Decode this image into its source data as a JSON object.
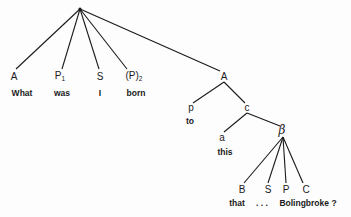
{
  "diagram": {
    "type": "syntax-tree",
    "root": {
      "x": 80,
      "y": 9
    },
    "colors": {
      "line": "#1a1a1a",
      "text": "#1a1a1a",
      "background": "#fdfdfd"
    },
    "nodes": [
      {
        "id": "n-A1",
        "label": "A",
        "sub": "",
        "x": 14,
        "y": 77
      },
      {
        "id": "n-P1",
        "label": "P",
        "sub": "1",
        "x": 60,
        "y": 77
      },
      {
        "id": "n-S1",
        "label": "S",
        "sub": "",
        "x": 100,
        "y": 77
      },
      {
        "id": "n-P2",
        "label": "(P)",
        "sub": "2",
        "x": 134,
        "y": 77
      },
      {
        "id": "n-A2",
        "label": "A",
        "sub": "",
        "x": 224,
        "y": 77
      },
      {
        "id": "n-p",
        "label": "p",
        "sub": "",
        "x": 191,
        "y": 108
      },
      {
        "id": "n-c",
        "label": "c",
        "sub": "",
        "x": 247,
        "y": 108
      },
      {
        "id": "n-a",
        "label": "a",
        "sub": "",
        "x": 222,
        "y": 138
      },
      {
        "id": "n-beta",
        "label": "β",
        "sub": "",
        "x": 282,
        "y": 130
      },
      {
        "id": "n-B",
        "label": "B",
        "sub": "",
        "x": 242,
        "y": 190
      },
      {
        "id": "n-S2",
        "label": "S",
        "sub": "",
        "x": 268,
        "y": 190
      },
      {
        "id": "n-P3",
        "label": "P",
        "sub": "",
        "x": 286,
        "y": 190
      },
      {
        "id": "n-C",
        "label": "C",
        "sub": "",
        "x": 306,
        "y": 190
      }
    ],
    "words": [
      {
        "id": "w-what",
        "text": "What",
        "x": 22,
        "y": 93
      },
      {
        "id": "w-was",
        "text": "was",
        "x": 62,
        "y": 93
      },
      {
        "id": "w-i",
        "text": "I",
        "x": 100,
        "y": 93
      },
      {
        "id": "w-born",
        "text": "born",
        "x": 136,
        "y": 93
      },
      {
        "id": "w-to",
        "text": "to",
        "x": 190,
        "y": 121
      },
      {
        "id": "w-this",
        "text": "this",
        "x": 225,
        "y": 152
      },
      {
        "id": "w-that",
        "text": "that",
        "x": 237,
        "y": 203
      },
      {
        "id": "w-dots",
        "text": ". . .",
        "x": 262,
        "y": 203
      },
      {
        "id": "w-bolingbroke",
        "text": "Bolingbroke ?",
        "x": 308,
        "y": 203
      }
    ],
    "edges": [
      [
        80,
        9,
        16,
        69
      ],
      [
        80,
        9,
        62,
        69
      ],
      [
        80,
        9,
        99,
        69
      ],
      [
        80,
        9,
        127,
        69
      ],
      [
        80,
        9,
        220,
        71
      ],
      [
        224,
        82,
        193,
        103
      ],
      [
        224,
        82,
        245,
        103
      ],
      [
        247,
        113,
        224,
        132
      ],
      [
        247,
        113,
        280,
        126
      ],
      [
        283,
        137,
        244,
        183
      ],
      [
        283,
        137,
        268,
        183
      ],
      [
        283,
        137,
        286,
        183
      ],
      [
        283,
        137,
        303,
        183
      ]
    ]
  }
}
